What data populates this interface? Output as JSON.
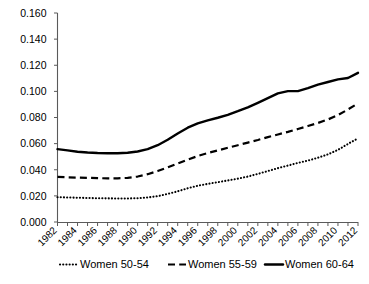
{
  "chart_data": {
    "type": "line",
    "title": "",
    "subtitle": "",
    "xlabel": "",
    "ylabel": "",
    "xlim": [
      1982,
      2012
    ],
    "ylim": [
      0.0,
      0.16
    ],
    "grid": false,
    "legend_position": "bottom",
    "x": [
      1982,
      1983,
      1984,
      1985,
      1986,
      1987,
      1988,
      1989,
      1990,
      1991,
      1992,
      1993,
      1994,
      1995,
      1996,
      1997,
      1998,
      1999,
      2000,
      2001,
      2002,
      2003,
      2004,
      2005,
      2006,
      2007,
      2008,
      2009,
      2010,
      2011,
      2012
    ],
    "xticklabels": [
      "1982",
      "1984",
      "1986",
      "1988",
      "1990",
      "1992",
      "1994",
      "1996",
      "1998",
      "2000",
      "2002",
      "2004",
      "2006",
      "2008",
      "2010",
      "2012"
    ],
    "xtick_values": [
      1982,
      1984,
      1986,
      1988,
      1990,
      1992,
      1994,
      1996,
      1998,
      2000,
      2002,
      2004,
      2006,
      2008,
      2010,
      2012
    ],
    "yticklabels": [
      "0.000",
      "0.020",
      "0.040",
      "0.060",
      "0.080",
      "0.100",
      "0.120",
      "0.140",
      "0.160"
    ],
    "ytick_values": [
      0.0,
      0.02,
      0.04,
      0.06,
      0.08,
      0.1,
      0.12,
      0.14,
      0.16
    ],
    "series": [
      {
        "name": "Women 50-54",
        "style": "dotted",
        "color": "#000000",
        "values": [
          0.019,
          0.0188,
          0.0186,
          0.0184,
          0.0182,
          0.0181,
          0.018,
          0.018,
          0.0182,
          0.0188,
          0.0198,
          0.0215,
          0.0235,
          0.0258,
          0.0278,
          0.0292,
          0.0305,
          0.0318,
          0.0332,
          0.0348,
          0.0368,
          0.039,
          0.0412,
          0.0432,
          0.0452,
          0.047,
          0.0492,
          0.0518,
          0.0552,
          0.0598,
          0.064
        ]
      },
      {
        "name": "Women 55-59",
        "style": "dashed",
        "color": "#000000",
        "values": [
          0.0345,
          0.0342,
          0.034,
          0.0338,
          0.0336,
          0.0334,
          0.0334,
          0.0338,
          0.0348,
          0.0366,
          0.039,
          0.0418,
          0.0448,
          0.0478,
          0.0505,
          0.0528,
          0.0548,
          0.0568,
          0.0588,
          0.0608,
          0.0628,
          0.065,
          0.067,
          0.069,
          0.0712,
          0.0735,
          0.0758,
          0.0785,
          0.0818,
          0.0862,
          0.0908
        ]
      },
      {
        "name": "Women 60-64",
        "style": "solid",
        "color": "#000000",
        "values": [
          0.0558,
          0.0548,
          0.0538,
          0.0532,
          0.0528,
          0.0526,
          0.0526,
          0.053,
          0.054,
          0.0558,
          0.0588,
          0.063,
          0.0678,
          0.0722,
          0.0755,
          0.0778,
          0.0798,
          0.082,
          0.0848,
          0.0878,
          0.0912,
          0.0948,
          0.0985,
          0.1002,
          0.1002,
          0.1025,
          0.1052,
          0.1072,
          0.1092,
          0.1102,
          0.1142
        ]
      }
    ],
    "legend": [
      {
        "label": "Women 50-54",
        "style": "dotted"
      },
      {
        "label": "Women 55-59",
        "style": "dashed"
      },
      {
        "label": "Women 60-64",
        "style": "solid"
      }
    ]
  }
}
